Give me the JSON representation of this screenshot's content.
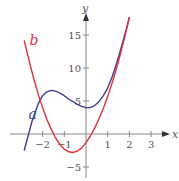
{
  "chart_data": {
    "type": "line",
    "title": "",
    "xlabel": "x",
    "ylabel": "y",
    "xlim": [
      -2.9,
      3.6
    ],
    "ylim": [
      -6,
      17.5
    ],
    "grid": false,
    "x_ticks": [
      -2,
      -1,
      1,
      2,
      3
    ],
    "x_tick_labels": [
      "−2",
      "−1",
      "1",
      "2",
      "3"
    ],
    "y_ticks": [
      -5,
      5,
      10,
      15
    ],
    "y_tick_labels": [
      "−5",
      "5",
      "10",
      "15"
    ],
    "series": [
      {
        "name": "a",
        "color": "#3a3f8f",
        "x": [
          -2.85,
          -2.5,
          -2.2,
          -2.0,
          -1.8,
          -1.6,
          -1.4,
          -1.2,
          -1.0,
          -0.8,
          -0.6,
          -0.4,
          -0.2,
          0.0,
          0.2,
          0.4,
          0.6,
          0.8,
          1.0,
          1.2,
          1.4,
          1.6,
          1.8,
          2.0
        ],
        "y": [
          -2.5,
          1.8,
          4.6,
          5.8,
          6.4,
          6.6,
          6.5,
          6.2,
          5.8,
          5.3,
          4.9,
          4.5,
          4.2,
          4.0,
          4.0,
          4.3,
          4.9,
          5.8,
          7.0,
          8.6,
          10.6,
          12.8,
          15.2,
          17.7
        ]
      },
      {
        "name": "b",
        "color": "#e0303a",
        "x": [
          -2.85,
          -2.6,
          -2.4,
          -2.2,
          -2.0,
          -1.8,
          -1.6,
          -1.4,
          -1.2,
          -1.0,
          -0.8,
          -0.6,
          -0.4,
          -0.2,
          0.0,
          0.2,
          0.4,
          0.6,
          0.8,
          1.0,
          1.2,
          1.4,
          1.6,
          1.8,
          2.0
        ],
        "y": [
          14.2,
          10.8,
          8.3,
          6.0,
          4.0,
          2.2,
          0.7,
          -0.6,
          -1.6,
          -2.3,
          -2.7,
          -2.8,
          -2.6,
          -2.1,
          -1.3,
          -0.3,
          0.9,
          2.3,
          3.9,
          5.7,
          7.7,
          9.9,
          12.3,
          14.9,
          17.7
        ]
      }
    ],
    "annotations": [
      {
        "text": "a",
        "x": -2.65,
        "y": 2.2,
        "color": "#3a3f8f"
      },
      {
        "text": "b",
        "x": -2.6,
        "y": 13.5,
        "color": "#e0303a"
      }
    ],
    "legend": "none (curves labeled inline)"
  }
}
